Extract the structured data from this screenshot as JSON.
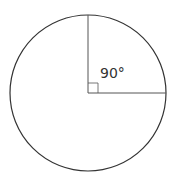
{
  "diagram": {
    "type": "circle-with-right-angle-sector",
    "circle": {
      "cx": 88,
      "cy": 93,
      "r": 78,
      "stroke": "#333333"
    },
    "radii": [
      {
        "direction": "up",
        "x2": 88,
        "y2": 15
      },
      {
        "direction": "right",
        "x2": 166,
        "y2": 93
      }
    ],
    "right_angle_marker": {
      "size": 10
    },
    "angle_label": "90°"
  }
}
